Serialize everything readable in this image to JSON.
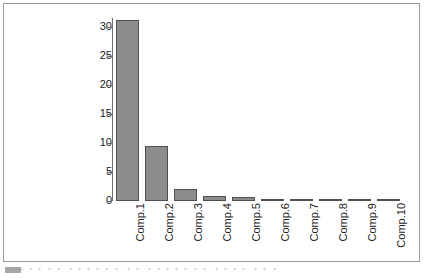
{
  "figure": {
    "border_color": "#9a9a9a",
    "background": "#ffffff"
  },
  "caption": {
    "text": "—— ・・・・ ・・・・・・ ・・ ・・・・・・・ ・・・・ ・・・",
    "swatch_name": "caption-marker"
  },
  "chart_data": {
    "type": "bar",
    "title": "",
    "xlabel": "",
    "ylabel": "",
    "categories": [
      "Comp.1",
      "Comp.2",
      "Comp.3",
      "Comp.4",
      "Comp.5",
      "Comp.6",
      "Comp.7",
      "Comp.8",
      "Comp.9",
      "Comp.10"
    ],
    "values": [
      31.2,
      9.5,
      2.1,
      0.9,
      0.7,
      0.35,
      0.3,
      0.22,
      0.15,
      0.12
    ],
    "ylim": [
      0,
      31.5
    ],
    "yticks": [
      0,
      5,
      10,
      15,
      20,
      25,
      30
    ],
    "ytick_labels": [
      "0",
      "5",
      "10",
      "15",
      "20",
      "25",
      "30"
    ],
    "grid": false,
    "legend": null,
    "bar_fill_color": "#8d8d8d",
    "bar_border_color": "#4f4f4f",
    "axis_color": "#6d6d6d"
  }
}
